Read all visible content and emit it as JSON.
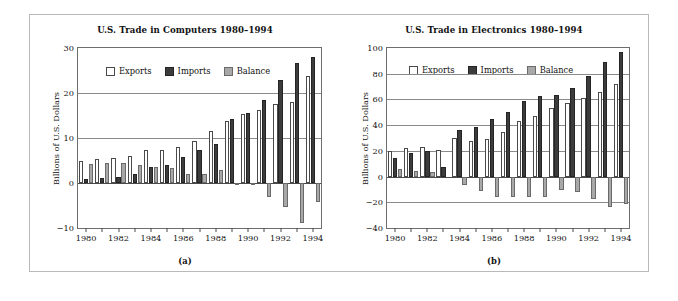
{
  "figure": {
    "background": "#ffffff",
    "frame_color": "#b9b9b9",
    "series_colors": {
      "exports": "#ffffff",
      "imports": "#3c3c3c",
      "balance": "#a8a8a8"
    }
  },
  "legend": {
    "exports_label": "Exports",
    "imports_label": "Imports",
    "balance_label": "Balance"
  },
  "panel_a": {
    "caption": "(a)",
    "ylabel": "Billions of U.S. Dollars"
  },
  "panel_b": {
    "caption": "(b)",
    "ylabel": "Billions of U.S. Dollars"
  },
  "chart_data": [
    {
      "type": "bar",
      "panel": "(a)",
      "title": "U.S. Trade in Computers 1980–1994",
      "xlabel": "",
      "ylabel": "Billions of U.S. Dollars",
      "ylim": [
        -10,
        30
      ],
      "yticks": [
        -10,
        0,
        10,
        20,
        30
      ],
      "ytick_labels": [
        "-10",
        "0",
        "10",
        "20",
        "30"
      ],
      "grid": true,
      "legend_position": "upper-left-inside",
      "categories": [
        1980,
        1981,
        1982,
        1983,
        1984,
        1985,
        1986,
        1987,
        1988,
        1989,
        1990,
        1991,
        1992,
        1993,
        1994
      ],
      "xtick_labels": [
        "1980",
        "1982",
        "1984",
        "1986",
        "1988",
        "1990",
        "1992",
        "1994"
      ],
      "series": [
        {
          "name": "Exports",
          "values": [
            4.9,
            5.3,
            5.5,
            5.9,
            7.3,
            7.4,
            7.9,
            9.3,
            11.5,
            13.7,
            15.3,
            16.2,
            17.6,
            18.1,
            23.7
          ]
        },
        {
          "name": "Imports",
          "values": [
            1.0,
            1.2,
            1.3,
            2.0,
            3.6,
            4.1,
            5.7,
            7.4,
            8.6,
            14.2,
            15.6,
            18.4,
            22.8,
            26.7,
            27.9
          ]
        },
        {
          "name": "Balance",
          "values": [
            4.2,
            4.4,
            4.4,
            3.9,
            3.5,
            3.3,
            2.1,
            1.9,
            3.0,
            -0.5,
            -0.3,
            -3.0,
            -5.4,
            -8.9,
            -4.3
          ]
        }
      ]
    },
    {
      "type": "bar",
      "panel": "(b)",
      "title": "U.S. Trade in Electronics 1980–1994",
      "xlabel": "",
      "ylabel": "Billions of U.S. Dollars",
      "ylim": [
        -40,
        100
      ],
      "yticks": [
        -40,
        -20,
        0,
        20,
        40,
        60,
        80,
        100
      ],
      "ytick_labels": [
        "-40",
        "-20",
        "0",
        "20",
        "40",
        "60",
        "80",
        "100"
      ],
      "grid": true,
      "legend_position": "upper-left-inside",
      "categories": [
        1980,
        1981,
        1982,
        1983,
        1984,
        1985,
        1986,
        1987,
        1988,
        1989,
        1990,
        1991,
        1992,
        1993,
        1994
      ],
      "xtick_labels": [
        "1980",
        "1982",
        "1984",
        "1986",
        "1988",
        "1990",
        "1992",
        "1994"
      ],
      "series": [
        {
          "name": "Exports",
          "values": [
            20.2,
            22.3,
            23.2,
            20.7,
            29.7,
            27.4,
            29.1,
            34.8,
            43.4,
            47.5,
            53.4,
            57.1,
            61.2,
            65.6,
            71.8
          ]
        },
        {
          "name": "Imports",
          "values": [
            14.7,
            18.2,
            19.8,
            7.3,
            36.6,
            38.5,
            44.5,
            50.2,
            58.5,
            62.7,
            63.8,
            68.9,
            78.1,
            89.4,
            96.6
          ]
        },
        {
          "name": "Balance",
          "values": [
            5.7,
            4.2,
            3.3,
            0.0,
            -6.9,
            -11.6,
            -15.8,
            -16.0,
            -15.7,
            -15.6,
            -10.8,
            -11.9,
            -17.5,
            -23.8,
            -21.6
          ]
        }
      ]
    }
  ]
}
